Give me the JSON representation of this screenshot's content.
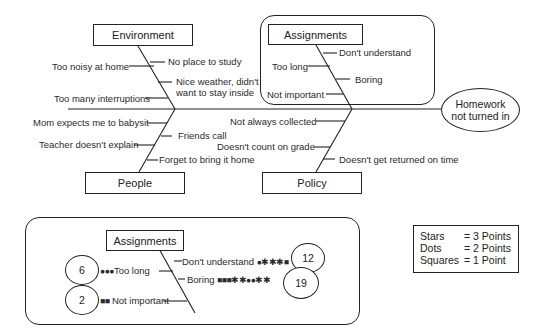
{
  "fishbone": {
    "effect": "Homework not turned in",
    "categories": {
      "environment": {
        "label": "Environment",
        "causes": [
          "No place to study",
          "Too noisy at home",
          "Nice weather, didn't want to stay inside",
          "Too many interruptions"
        ]
      },
      "assignments": {
        "label": "Assignments",
        "causes": [
          "Don't understand",
          "Too long",
          "Boring",
          "Not important"
        ]
      },
      "people": {
        "label": "People",
        "causes": [
          "Mom expects me to babysit",
          "Friends call",
          "Teacher doesn't explain",
          "Forget to bring it home"
        ]
      },
      "policy": {
        "label": "Policy",
        "causes": [
          "Not always collected",
          "Doesn't count on grade",
          "Doesn't get returned on time"
        ]
      }
    }
  },
  "detail": {
    "label": "Assignments",
    "items": [
      {
        "cause": "Don't understand",
        "symbols": "●✱✱✱■",
        "score": "12"
      },
      {
        "cause": "Too long",
        "symbols": "●●●",
        "score": "6"
      },
      {
        "cause": "Boring",
        "symbols": "■■■✱✱●●✱✱",
        "score": "19"
      },
      {
        "cause": "Not important",
        "symbols": "■■",
        "score": "2"
      }
    ]
  },
  "legend": [
    {
      "key": "Stars",
      "value": "= 3 Points"
    },
    {
      "key": "Dots",
      "value": "= 2 Points"
    },
    {
      "key": "Squares",
      "value": "= 1 Point"
    }
  ]
}
